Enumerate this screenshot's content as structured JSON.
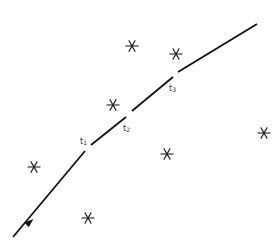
{
  "diagram": {
    "type": "trajectory-with-points",
    "colors": {
      "line": "#111111",
      "star": "#222222",
      "label": "#333333",
      "background": "#ffffff"
    },
    "trajectory": {
      "start": [
        13,
        237
      ],
      "end": [
        257,
        24
      ],
      "direction_arrow_at": [
        30,
        222
      ],
      "segments": [
        {
          "from": [
            13,
            237
          ],
          "to": [
            85,
            151
          ]
        },
        {
          "from": [
            91,
            145
          ],
          "to": [
            126,
            117
          ]
        },
        {
          "from": [
            132,
            111
          ],
          "to": [
            173,
            77
          ]
        },
        {
          "from": [
            178,
            72
          ],
          "to": [
            257,
            24
          ]
        }
      ]
    },
    "time_labels": [
      {
        "base": "t",
        "sub": "1",
        "x": 80,
        "y": 138
      },
      {
        "base": "t",
        "sub": "2",
        "x": 123,
        "y": 125
      },
      {
        "base": "t",
        "sub": "3",
        "x": 169,
        "y": 85
      }
    ],
    "stars": [
      {
        "x": 132,
        "y": 46
      },
      {
        "x": 176,
        "y": 54
      },
      {
        "x": 113,
        "y": 105
      },
      {
        "x": 264,
        "y": 133
      },
      {
        "x": 34,
        "y": 167
      },
      {
        "x": 167,
        "y": 154
      },
      {
        "x": 88,
        "y": 218
      }
    ]
  }
}
